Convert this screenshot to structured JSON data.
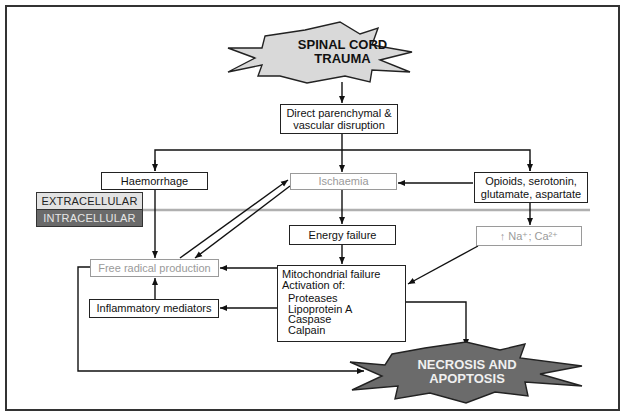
{
  "diagram": {
    "nodes": {
      "trauma": "SPINAL CORD TRAUMA",
      "trauma_line1": "SPINAL CORD",
      "trauma_line2": "TRAUMA",
      "direct": "Direct parenchymal & vascular disruption",
      "direct_line1": "Direct parenchymal &",
      "direct_line2": "vascular disruption",
      "haemorrhage": "Haemorrhage",
      "ischaemia": "Ischaemia",
      "opioids_line1": "Opioids, serotonin,",
      "opioids_line2": "glutamate, aspartate",
      "energy": "Energy failure",
      "ions": "↑ Na⁺; Ca²⁺",
      "free_radical": "Free radical production",
      "inflammatory": "Inflammatory mediators",
      "mito_line1": "Mitochondrial failure",
      "mito_line2": "Activation of:",
      "mito_items": [
        "Proteases",
        "Lipoprotein A",
        "Caspase",
        "Calpain"
      ],
      "necrosis_line1": "NECROSIS AND",
      "necrosis_line2": "APOPTOSIS"
    },
    "zones": {
      "extracellular": "EXTRACELLULAR",
      "intracellular": "INTRACELLULAR"
    },
    "edges": [
      {
        "from": "trauma",
        "to": "direct"
      },
      {
        "from": "direct",
        "to": "haemorrhage"
      },
      {
        "from": "direct",
        "to": "ischaemia"
      },
      {
        "from": "direct",
        "to": "opioids"
      },
      {
        "from": "opioids",
        "to": "ischaemia"
      },
      {
        "from": "opioids",
        "to": "ions"
      },
      {
        "from": "ischaemia",
        "to": "energy"
      },
      {
        "from": "ischaemia",
        "to": "free_radical"
      },
      {
        "from": "free_radical",
        "to": "ischaemia"
      },
      {
        "from": "haemorrhage",
        "to": "free_radical"
      },
      {
        "from": "energy",
        "to": "mitochondrial"
      },
      {
        "from": "ions",
        "to": "mitochondrial"
      },
      {
        "from": "mitochondrial",
        "to": "free_radical"
      },
      {
        "from": "mitochondrial",
        "to": "inflammatory"
      },
      {
        "from": "inflammatory",
        "to": "free_radical"
      },
      {
        "from": "mitochondrial",
        "to": "necrosis"
      },
      {
        "from": "free_radical",
        "to": "necrosis"
      }
    ],
    "colors": {
      "trauma_fill": "#d9d9d9",
      "necrosis_fill": "#6b6b6b",
      "necrosis_text": "#f0f0f0",
      "gray_box": "#9a9a9a",
      "separator": "#b0b0b0"
    }
  }
}
